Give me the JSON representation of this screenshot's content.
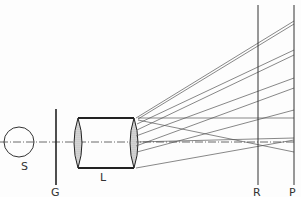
{
  "diagram": {
    "labels": {
      "source": "S",
      "grid": "G",
      "lens": "L",
      "plane_r": "R",
      "plane_p": "P"
    },
    "colors": {
      "line": "#333333",
      "lens_fill": "#bdbdbd",
      "ray": "#555555"
    }
  }
}
